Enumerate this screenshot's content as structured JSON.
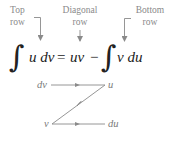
{
  "labels": {
    "top": {
      "line1": "Top",
      "line2": "row"
    },
    "diagonal": {
      "line1": "Diagonal",
      "line2": "row"
    },
    "bottom": {
      "line1": "Bottom",
      "line2": "row"
    }
  },
  "equation": {
    "integral_symbol": "∫",
    "lhs_integrand": "u dv",
    "equals": "=",
    "product": "uv",
    "minus": "−",
    "rhs_integrand": "v du"
  },
  "z_diagram": {
    "top_left": "dv",
    "top_right": "u",
    "bottom_left": "v",
    "bottom_right": "du"
  },
  "colors": {
    "label_text": "#8a8a8a",
    "equation_text": "#222222",
    "diagram_lines": "#8a8a8a"
  }
}
